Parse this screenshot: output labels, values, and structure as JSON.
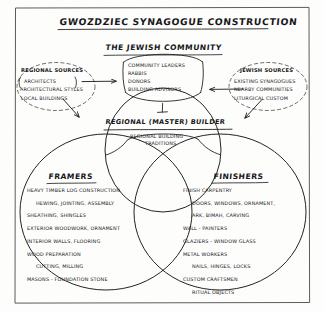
{
  "diagram": {
    "title": "GWOZDZIEC SYNAGOGUE CONSTRUCTION",
    "style": "hand-drawn concept map",
    "border_color": "#4a4a4a",
    "ink_color": "#17171a"
  },
  "community": {
    "heading": "THE JEWISH COMMUNITY",
    "members": [
      "COMMUNITY LEADERS",
      "RABBIS",
      "DONORS",
      "BUILDING ADVISORS"
    ]
  },
  "left_cluster": {
    "heading": "REGIONAL SOURCES",
    "items": [
      "ARCHITECTS",
      "ARCHITECTURAL STYLES",
      "LOCAL BUILDINGS"
    ]
  },
  "right_cluster": {
    "heading": "JEWISH SOURCES",
    "items": [
      "EXISTING SYNAGOGUES",
      "NEARBY COMMUNITIES",
      "LITURGICAL CUSTOM"
    ]
  },
  "builder": {
    "heading": "REGIONAL (MASTER) BUILDER",
    "note_line1": "REGIONAL BUILDING",
    "note_line2": "TRADITIONS"
  },
  "venn": {
    "framers": {
      "heading": "FRAMERS",
      "lines": [
        {
          "text": "HEAVY TIMBER LOG CONSTRUCTION",
          "indent": false
        },
        {
          "text": "HEWING, JOINTING, ASSEMBLY",
          "indent": true
        },
        {
          "text": "SHEATHING, SHINGLES",
          "indent": false
        },
        {
          "text": "EXTERIOR WOODWORK, ORNAMENT",
          "indent": false
        },
        {
          "text": "INTERIOR WALLS, FLOORING",
          "indent": false
        },
        {
          "text": "WOOD PREPARATION",
          "indent": false
        },
        {
          "text": "CUTTING, MILLING",
          "indent": true
        },
        {
          "text": "MASONS - FOUNDATION STONE",
          "indent": false
        }
      ]
    },
    "finishers": {
      "heading": "FINISHERS",
      "lines": [
        {
          "text": "FINISH CARPENTRY",
          "indent": false
        },
        {
          "text": "DOORS, WINDOWS, ORNAMENT,",
          "indent": true
        },
        {
          "text": "ARK, BIMAH, CARVING",
          "indent": true
        },
        {
          "text": "WALL - PAINTERS",
          "indent": false
        },
        {
          "text": "GLAZIERS - WINDOW GLASS",
          "indent": false
        },
        {
          "text": "METAL WORKERS",
          "indent": false
        },
        {
          "text": "NAILS, HINGES, LOCKS",
          "indent": true
        },
        {
          "text": "CUSTOM CRAFTSMEN",
          "indent": false
        },
        {
          "text": "RITUAL OBJECTS",
          "indent": true
        }
      ]
    }
  },
  "connectors": {
    "left_arrow": "arrow-right",
    "right_arrow": "arrow-left",
    "left_diagonal": "arrow-down-right",
    "right_diagonal": "arrow-down-left"
  }
}
